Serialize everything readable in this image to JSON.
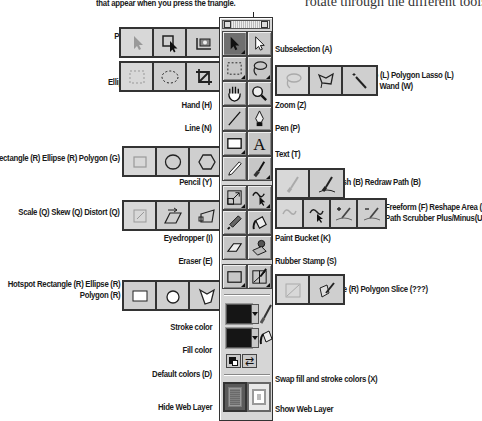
{
  "header": {
    "note_left": "that appear when you press the triangle.",
    "note_right": "rotate through the different tools."
  },
  "left_labels": {
    "pointer_group": [
      "Pointer (V) Select Behind (V)",
      "Export Area (J)"
    ],
    "marquee_group": [
      "Rectangular Marquee (M)",
      "Elliptical Marquee (M) Crop (C)"
    ],
    "hand": "Hand (H)",
    "line": "Line (N)",
    "shape_group": "Rectangle (R) Ellipse (R) Polygon (G)",
    "pencil": "Pencil (Y)",
    "transform_group": "Scale (Q) Skew (Q) Distort (Q)",
    "eyedropper": "Eyedropper (I)",
    "eraser": "Eraser (E)",
    "hotspot_group": [
      "Hotspot Rectangle (R) Ellipse (R)",
      "Polygon (R)"
    ],
    "stroke_color": "Stroke color",
    "fill_color": "Fill color",
    "default_colors": "Default colors (D)",
    "hide_web_layer": "Hide Web Layer"
  },
  "right_labels": {
    "subselection": "Subselection (A)",
    "lasso_group": [
      "Lasso (L) Polygon Lasso (L)",
      "Magic Wand (W)"
    ],
    "zoom": "Zoom (Z)",
    "pen": "Pen (P)",
    "text": "Text (T)",
    "brush_group": "Brush (B) Redraw Path (B)",
    "freeform_group": [
      "Freeform (F) Reshape Area (F)",
      "Path Scrubber Plus/Minus(U)"
    ],
    "paint_bucket": "Paint Bucket (K)",
    "rubber_stamp": "Rubber Stamp (S)",
    "slice_group": "Slice (R) Polygon Slice (???)",
    "swap_colors": "Swap fill and stroke colors (X)",
    "show_web_layer": "Show Web Layer"
  },
  "toolbar": {
    "tools": [
      [
        "pointer",
        "subselection"
      ],
      [
        "marquee",
        "lasso"
      ],
      [
        "hand",
        "zoom"
      ],
      [
        "line",
        "pen"
      ],
      [
        "rectangle",
        "text"
      ],
      [
        "pencil",
        "brush"
      ],
      [
        "scale",
        "freeform"
      ],
      [
        "eyedropper",
        "paint-bucket"
      ],
      [
        "eraser",
        "rubber-stamp"
      ],
      [
        "hotspot",
        "slice"
      ]
    ],
    "selected_tool": "pointer",
    "stroke_color": "#151515",
    "fill_color": "#151515"
  },
  "colors": {
    "panel_bg": "#d6d6d6",
    "tool_bg": "#c7c7c7",
    "selected_tool_bg": "#6f6f6f",
    "web_layer_hidden": "#7a7a7a"
  }
}
